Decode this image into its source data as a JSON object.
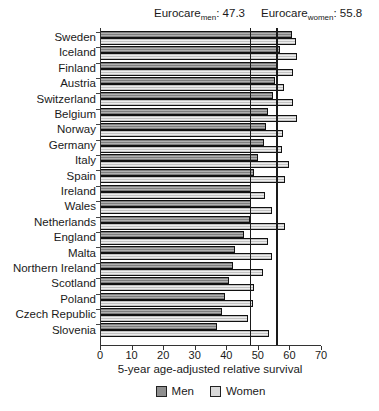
{
  "annotations": {
    "men": {
      "base": "Eurocare",
      "sub": "men",
      "value": ": 47.3"
    },
    "women": {
      "base": "Eurocare",
      "sub": "women",
      "value": ": 55.8"
    }
  },
  "chart_data": {
    "type": "bar",
    "orientation": "horizontal",
    "title": "",
    "xlabel": "5-year age-adjusted relative survival",
    "xlim": [
      0,
      70
    ],
    "xticks": [
      0,
      10,
      20,
      30,
      40,
      50,
      60,
      70
    ],
    "grid": false,
    "legend_position": "bottom",
    "legend": [
      "Men",
      "Women"
    ],
    "categories": [
      "Sweden",
      "Iceland",
      "Finland",
      "Austria",
      "Switzerland",
      "Belgium",
      "Norway",
      "Germany",
      "Italy",
      "Spain",
      "Ireland",
      "Wales",
      "Netherlands",
      "England",
      "Malta",
      "Northern Ireland",
      "Scotland",
      "Poland",
      "Czech Republic",
      "Slovenia"
    ],
    "series": [
      {
        "name": "Men",
        "values": [
          60.4,
          56.6,
          55.8,
          55.1,
          54.4,
          52.8,
          52.3,
          51.4,
          49.6,
          48.4,
          47.5,
          47.3,
          47.1,
          45.3,
          42.2,
          41.8,
          40.3,
          39.0,
          38.1,
          36.5
        ]
      },
      {
        "name": "Women",
        "values": [
          61.7,
          62.0,
          60.8,
          57.9,
          60.7,
          61.9,
          57.6,
          57.3,
          59.4,
          58.1,
          51.8,
          54.1,
          58.1,
          52.8,
          54.1,
          51.2,
          48.5,
          48.2,
          46.6,
          53.1
        ]
      }
    ],
    "reference_lines": [
      {
        "name": "Eurocare men",
        "value": 47.3
      },
      {
        "name": "Eurocare women",
        "value": 55.8
      }
    ]
  },
  "colors": {
    "men": "#8f8f8f",
    "women": "#d9d9d9",
    "bar_outline": "#111111",
    "reference_line": "#1a1a1a",
    "axis": "#333333",
    "text": "#1a1a1a",
    "background": "#ffffff"
  }
}
